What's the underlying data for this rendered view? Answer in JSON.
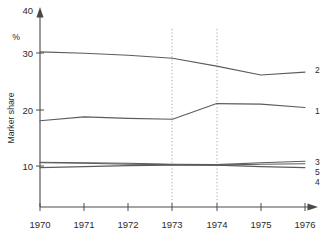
{
  "chart_data": {
    "type": "line",
    "title": "",
    "subtitle": "",
    "xlabel": "",
    "ylabel": "Marker share",
    "ylabel_unit": "%",
    "x": [
      1970,
      1971,
      1972,
      1973,
      1974,
      1975,
      1976
    ],
    "xtick_labels": [
      "1970",
      "1971",
      "1972",
      "1973",
      "1974",
      "1975",
      "1976"
    ],
    "ytick_labels": [
      "10",
      "20",
      "30",
      "40"
    ],
    "yticks": [
      10,
      20,
      30,
      40
    ],
    "xlim": [
      1970,
      1976
    ],
    "ylim": [
      0,
      40
    ],
    "grid": false,
    "legend": "inline-right-end",
    "annotations": {
      "vertical_guides": [
        1973,
        1974
      ],
      "guide_style": "dotted"
    },
    "series": [
      {
        "name": "2",
        "label": "2",
        "values": [
          31.5,
          31.2,
          30.8,
          30.2,
          28.6,
          26.8,
          27.4
        ]
      },
      {
        "name": "1",
        "label": "1",
        "values": [
          17.5,
          18.3,
          18.0,
          17.8,
          21.0,
          20.9,
          20.2
        ]
      },
      {
        "name": "3",
        "label": "3",
        "values": [
          9.1,
          9.0,
          8.9,
          8.7,
          8.6,
          9.0,
          9.3
        ]
      },
      {
        "name": "5",
        "label": "5",
        "values": [
          9.0,
          8.9,
          8.7,
          8.6,
          8.5,
          8.7,
          8.8
        ]
      },
      {
        "name": "4",
        "label": "4",
        "values": [
          8.0,
          8.2,
          8.4,
          8.5,
          8.5,
          8.2,
          8.0
        ]
      }
    ]
  },
  "axes": {
    "y_title_text": "Marker share",
    "y_unit_text": "%",
    "y_labels": [
      "40",
      "30",
      "20",
      "10"
    ],
    "x_labels": [
      "1970",
      "1971",
      "1972",
      "1973",
      "1974",
      "1975",
      "1976"
    ]
  },
  "series_end_labels": [
    "2",
    "1",
    "3",
    "5",
    "4"
  ],
  "colors": {
    "axis": "#4a4a4a",
    "series": "#5c5c5c",
    "guide": "#9a9a9a",
    "text": "#2b2b2b",
    "background": "#ffffff"
  }
}
